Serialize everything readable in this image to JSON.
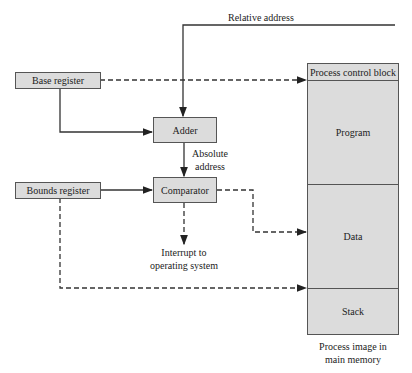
{
  "diagram": {
    "relative_address_label": "Relative address",
    "registers": {
      "base": "Base register",
      "bounds": "Bounds register"
    },
    "units": {
      "adder": "Adder",
      "comparator": "Comparator"
    },
    "absolute_address_label": [
      "Absolute",
      "address"
    ],
    "interrupt_label": [
      "Interrupt to",
      "operating system"
    ],
    "memory": {
      "segments": [
        "Process control block",
        "Program",
        "Data",
        "Stack"
      ],
      "caption": [
        "Process image in",
        "main memory"
      ]
    },
    "colors": {
      "box_fill": "#dcdcdc",
      "stroke": "#333333"
    }
  }
}
